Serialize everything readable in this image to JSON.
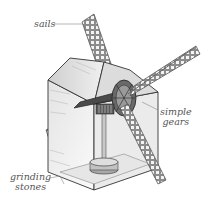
{
  "diagram": {
    "labels": {
      "sails": "sails",
      "gears_line1": "simple",
      "gears_line2": "gears",
      "stones_line1": "grinding",
      "stones_line2": "stones"
    },
    "colors": {
      "outline": "#333333",
      "wall_light": "#f2f2f2",
      "wall_mid": "#d6d6d6",
      "sail_fill": "#9a9a9a",
      "gear_dark": "#3a3a3a",
      "label_text": "#555555",
      "leader_line": "#888888"
    }
  }
}
